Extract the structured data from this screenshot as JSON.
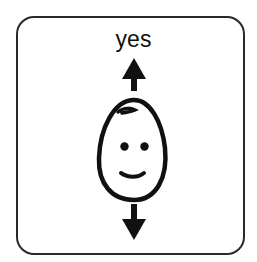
{
  "symbol_card": {
    "label": "yes",
    "icons": {
      "up_arrow": "arrow-up-icon",
      "face": "smiling-face-icon",
      "down_arrow": "arrow-down-icon"
    },
    "colors": {
      "ink": "#111111",
      "border": "#2a2a2a",
      "background": "#ffffff"
    }
  }
}
